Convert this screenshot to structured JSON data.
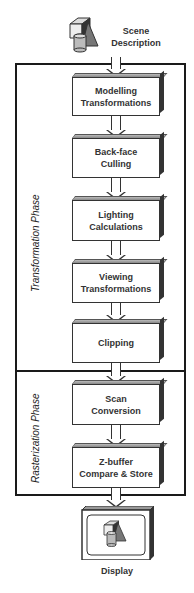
{
  "source": {
    "icon": "scene-objects-icon",
    "label_line1": "Scene",
    "label_line2": "Description"
  },
  "phases": [
    {
      "name": "Transformation Phase"
    },
    {
      "name": "Rasterization Phase"
    }
  ],
  "stages": [
    {
      "line1": "Modelling",
      "line2": "Transformations",
      "phase": "Transformation Phase"
    },
    {
      "line1": "Back-face",
      "line2": "Culling",
      "phase": "Transformation Phase"
    },
    {
      "line1": "Lighting",
      "line2": "Calculations",
      "phase": "Transformation Phase"
    },
    {
      "line1": "Viewing",
      "line2": "Transformations",
      "phase": "Transformation Phase"
    },
    {
      "line1": "Clipping",
      "line2": "",
      "phase": "Transformation Phase"
    },
    {
      "line1": "Scan",
      "line2": "Conversion",
      "phase": "Rasterization Phase"
    },
    {
      "line1": "Z-buffer",
      "line2": "Compare & Store",
      "phase": "Rasterization Phase"
    }
  ],
  "output": {
    "icon": "display-monitor-icon",
    "label": "Display"
  }
}
